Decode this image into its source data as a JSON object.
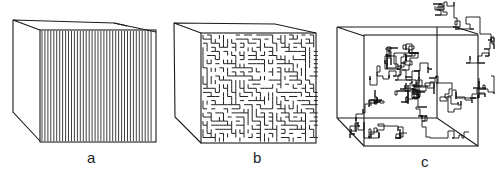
{
  "figure": {
    "panels": [
      {
        "id": "a",
        "label": "a",
        "description": "cube with parallel straight vertical channels on front face",
        "cube": {
          "back_top_left": [
            13,
            20
          ],
          "back_top_right": [
            114,
            23
          ],
          "front_top_left": [
            40,
            30
          ],
          "front_top_right": [
            156,
            32
          ],
          "front_bottom_left": [
            40,
            141
          ],
          "front_bottom_right": [
            156,
            143
          ],
          "back_bottom_left": [
            13,
            112
          ]
        },
        "stripe_count": 38
      },
      {
        "id": "b",
        "label": "b",
        "description": "cube with maze-like tortuous channel pattern on front face",
        "cube": {
          "back_top_left": [
            174,
            23
          ],
          "back_top_right": [
            275,
            24
          ],
          "front_top_left": [
            201,
            33
          ],
          "front_top_right": [
            316,
            33
          ],
          "front_bottom_left": [
            201,
            143
          ],
          "front_bottom_right": [
            316,
            143
          ],
          "back_bottom_left": [
            175,
            117
          ]
        }
      },
      {
        "id": "c",
        "label": "c",
        "description": "wireframe cube with random-walk lattice path extending through and beyond it",
        "cube": {
          "back_top_left": [
            337,
            27
          ],
          "back_top_right": [
            455,
            27
          ],
          "front_top_left": [
            364,
            36
          ],
          "front_top_right": [
            478,
            34
          ],
          "front_bottom_left": [
            364,
            146
          ],
          "front_bottom_right": [
            478,
            146
          ],
          "back_bottom_left": [
            337,
            118
          ],
          "back_bottom_right": [
            437,
            118
          ]
        }
      }
    ],
    "colors": {
      "line": "#1a1a1a",
      "background": "#ffffff"
    }
  }
}
